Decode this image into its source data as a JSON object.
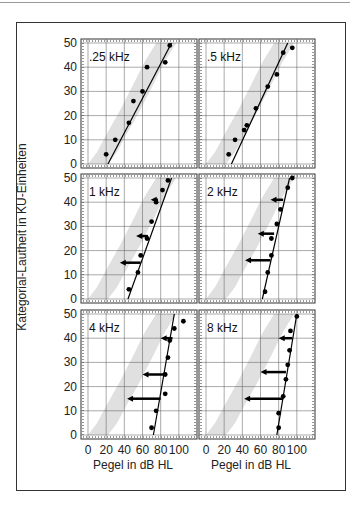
{
  "figure": {
    "ylabel": "Kategorial-Lautheit in KU-Einheiten",
    "xlabel": "Pegel in dB HL"
  },
  "chart_data": {
    "type": "scatter",
    "xlabel": "Pegel in dB HL",
    "ylabel": "Kategorial-Lautheit in KU-Einheiten",
    "xlim": [
      0,
      120
    ],
    "ylim": [
      0,
      50
    ],
    "xticks": [
      0,
      20,
      40,
      60,
      80,
      100
    ],
    "yticks": [
      0,
      10,
      20,
      30,
      40,
      50
    ],
    "grid": true,
    "panels": [
      {
        "title": ".25 kHz",
        "points": [
          [
            20,
            4
          ],
          [
            30,
            10
          ],
          [
            45,
            17
          ],
          [
            50,
            26
          ],
          [
            60,
            30
          ],
          [
            65,
            40
          ],
          [
            85,
            42
          ],
          [
            90,
            49
          ]
        ],
        "line": [
          [
            22,
            0
          ],
          [
            92,
            50
          ]
        ],
        "arrows": []
      },
      {
        "title": ".5 kHz",
        "points": [
          [
            25,
            4
          ],
          [
            32,
            10
          ],
          [
            42,
            14
          ],
          [
            45,
            16
          ],
          [
            55,
            23
          ],
          [
            68,
            32
          ],
          [
            78,
            37
          ],
          [
            85,
            46
          ],
          [
            95,
            48
          ]
        ],
        "line": [
          [
            28,
            0
          ],
          [
            90,
            50
          ]
        ],
        "arrows": []
      },
      {
        "title": "1 kHz",
        "points": [
          [
            45,
            4
          ],
          [
            55,
            11
          ],
          [
            58,
            18
          ],
          [
            65,
            25
          ],
          [
            70,
            32
          ],
          [
            75,
            40
          ],
          [
            82,
            45
          ],
          [
            88,
            49
          ]
        ],
        "line": [
          [
            44,
            0
          ],
          [
            92,
            50
          ]
        ],
        "arrows": [
          {
            "y": 15,
            "from": 58,
            "to": 35
          },
          {
            "y": 26,
            "from": 66,
            "to": 53
          },
          {
            "y": 41,
            "from": 77,
            "to": 69
          }
        ]
      },
      {
        "title": "2 kHz",
        "points": [
          [
            65,
            3
          ],
          [
            68,
            11
          ],
          [
            72,
            18
          ],
          [
            72,
            25
          ],
          [
            78,
            31
          ],
          [
            82,
            37
          ],
          [
            90,
            46
          ],
          [
            95,
            50
          ]
        ],
        "line": [
          [
            62,
            0
          ],
          [
            92,
            50
          ]
        ],
        "arrows": [
          {
            "y": 16,
            "from": 71,
            "to": 43
          },
          {
            "y": 27,
            "from": 75,
            "to": 57
          },
          {
            "y": 41,
            "from": 85,
            "to": 71
          }
        ]
      },
      {
        "title": "4 kHz",
        "points": [
          [
            70,
            3
          ],
          [
            75,
            10
          ],
          [
            85,
            17
          ],
          [
            85,
            25
          ],
          [
            88,
            32
          ],
          [
            90,
            39
          ],
          [
            95,
            44
          ],
          [
            105,
            47
          ]
        ],
        "line": [
          [
            72,
            0
          ],
          [
            95,
            50
          ]
        ],
        "arrows": [
          {
            "y": 15,
            "from": 80,
            "to": 43
          },
          {
            "y": 25,
            "from": 85,
            "to": 60
          },
          {
            "y": 40,
            "from": 93,
            "to": 80
          }
        ]
      },
      {
        "title": "8 kHz",
        "points": [
          [
            80,
            3
          ],
          [
            80,
            9
          ],
          [
            85,
            16
          ],
          [
            88,
            23
          ],
          [
            90,
            29
          ],
          [
            92,
            35
          ],
          [
            93,
            43
          ],
          [
            100,
            49
          ]
        ],
        "line": [
          [
            78,
            0
          ],
          [
            100,
            50
          ]
        ],
        "arrows": [
          {
            "y": 15,
            "from": 85,
            "to": 42
          },
          {
            "y": 26,
            "from": 88,
            "to": 60
          },
          {
            "y": 40,
            "from": 95,
            "to": 80
          }
        ]
      }
    ],
    "normal_band": "shaded region of normal-hearing loudness growth (approx. from 10 dB at 0 KU to 90 dB at 50 KU)"
  }
}
